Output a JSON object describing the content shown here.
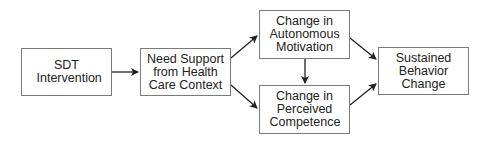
{
  "diagram": {
    "nodes": [
      {
        "id": "sdt",
        "label": "SDT Intervention"
      },
      {
        "id": "need",
        "label": "Need Support from Health Care Context"
      },
      {
        "id": "auto",
        "label": "Change in Autonomous Motivation"
      },
      {
        "id": "comp",
        "label": "Change in Perceived Competence"
      },
      {
        "id": "sust",
        "label": "Sustained Behavior Change"
      }
    ],
    "edges": [
      {
        "from": "sdt",
        "to": "need"
      },
      {
        "from": "need",
        "to": "auto"
      },
      {
        "from": "need",
        "to": "comp"
      },
      {
        "from": "auto",
        "to": "comp"
      },
      {
        "from": "auto",
        "to": "sust"
      },
      {
        "from": "comp",
        "to": "sust"
      }
    ]
  }
}
